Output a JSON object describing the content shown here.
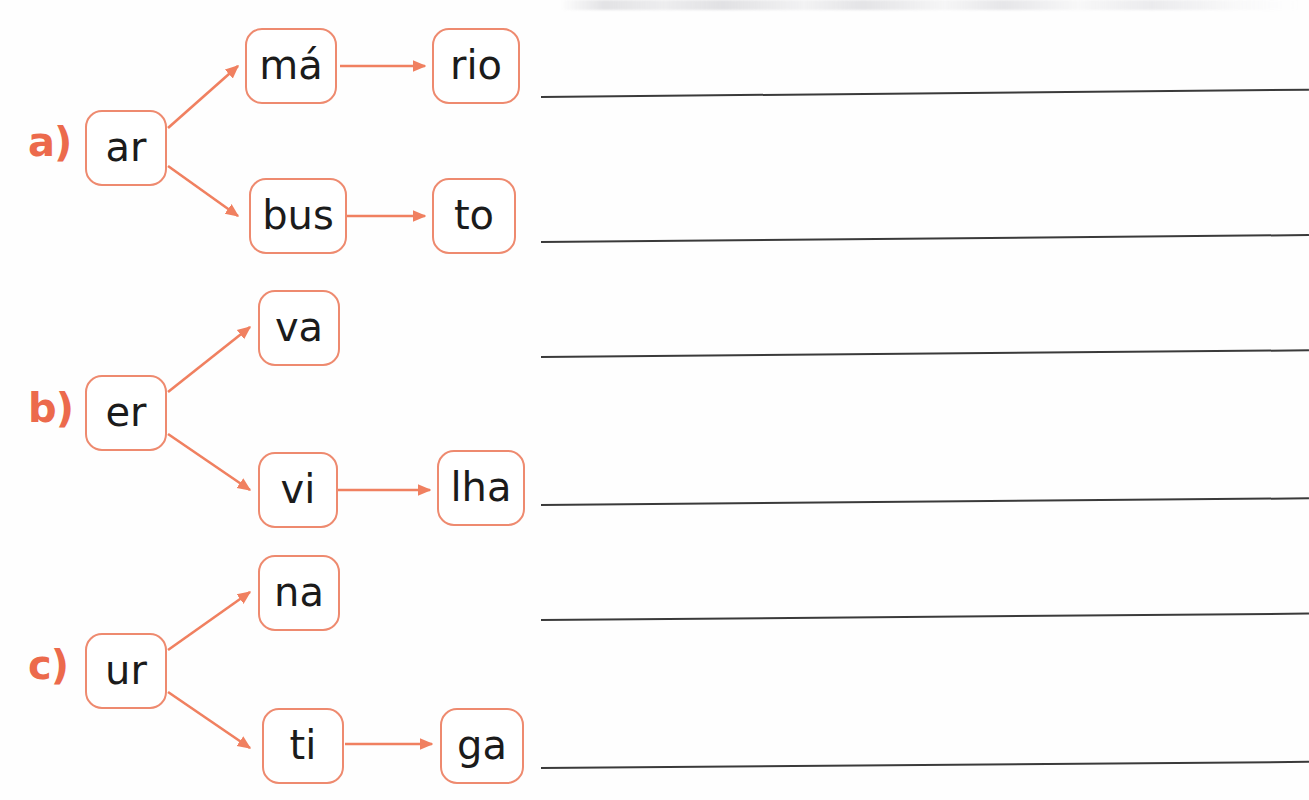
{
  "worksheet": {
    "colors": {
      "label_orange": "#ec6a4c",
      "box_border_orange": "#ee8a6f",
      "arrow_orange": "#f08060",
      "line_gray": "#3a3a3a",
      "text_black": "#1b1b1b"
    },
    "exercises": [
      {
        "label": "a)",
        "root": "ar",
        "branches": [
          {
            "syllables": [
              "má",
              "rio"
            ]
          },
          {
            "syllables": [
              "bus",
              "to"
            ]
          }
        ]
      },
      {
        "label": "b)",
        "root": "er",
        "branches": [
          {
            "syllables": [
              "va"
            ]
          },
          {
            "syllables": [
              "vi",
              "lha"
            ]
          }
        ]
      },
      {
        "label": "c)",
        "root": "ur",
        "branches": [
          {
            "syllables": [
              "na"
            ]
          },
          {
            "syllables": [
              "ti",
              "ga"
            ]
          }
        ]
      }
    ],
    "answer_lines": [
      {
        "name": "answer-line-a1"
      },
      {
        "name": "answer-line-a2"
      },
      {
        "name": "answer-line-b1"
      },
      {
        "name": "answer-line-b2"
      },
      {
        "name": "answer-line-c1"
      },
      {
        "name": "answer-line-c2"
      }
    ]
  }
}
